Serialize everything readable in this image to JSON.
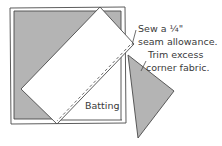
{
  "diagram": {
    "labels": {
      "sew_line1": "Sew a ¼\"",
      "sew_line2": "seam allowance.",
      "trim_line1": "Trim excess",
      "trim_line2": "corner fabric.",
      "batting": "Batting"
    },
    "colors": {
      "fabric_gray": "#b4b4b4",
      "outline": "#4a4a4a",
      "batting": "#ffffff",
      "strip": "#ffffff",
      "text": "#3a3a3a"
    }
  }
}
